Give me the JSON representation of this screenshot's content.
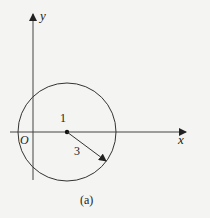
{
  "figure": {
    "caption": "(a)",
    "axes": {
      "x_label": "x",
      "y_label": "y",
      "origin_label": "O"
    },
    "circle": {
      "center_label": "1",
      "radius_label": "3"
    },
    "colors": {
      "stroke": "#333333",
      "background": "#f4f4f2"
    }
  }
}
